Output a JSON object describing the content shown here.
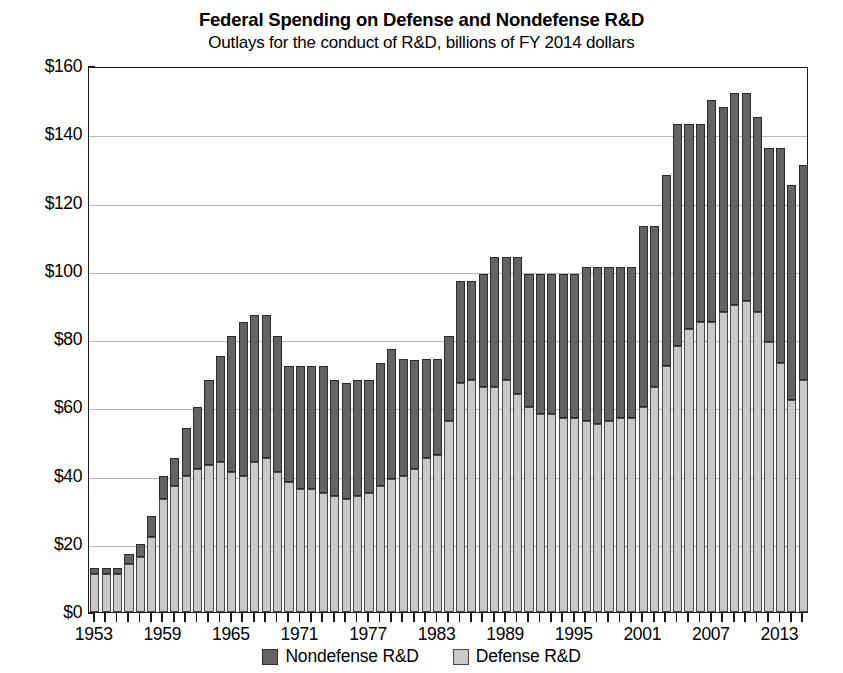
{
  "chart_data": {
    "type": "bar",
    "stacked": true,
    "title": "Federal Spending on Defense and Nondefense R&D",
    "subtitle": "Outlays for the conduct of R&D, billions of FY 2014 dollars",
    "xlabel": "",
    "ylabel": "",
    "ylim": [
      0,
      160
    ],
    "ytick_step": 20,
    "ytick_labels": [
      "$0",
      "$20",
      "$40",
      "$60",
      "$80",
      "$100",
      "$120",
      "$140",
      "$160"
    ],
    "grid": true,
    "legend_position": "bottom",
    "xtick_labels": [
      "1953",
      "1959",
      "1965",
      "1971",
      "1977",
      "1983",
      "1989",
      "1995",
      "2001",
      "2007",
      "2013"
    ],
    "xtick_years": [
      1953,
      1959,
      1965,
      1971,
      1977,
      1983,
      1989,
      1995,
      2001,
      2007,
      2013
    ],
    "colors": {
      "nondefense": "#636363",
      "defense": "#c9c9c9",
      "axis": "#1a1a1a",
      "grid": "#b9b9b9"
    },
    "categories": [
      1953,
      1954,
      1955,
      1956,
      1957,
      1958,
      1959,
      1960,
      1961,
      1962,
      1963,
      1964,
      1965,
      1966,
      1967,
      1968,
      1969,
      1970,
      1971,
      1972,
      1973,
      1974,
      1975,
      1976,
      1977,
      1978,
      1979,
      1980,
      1981,
      1982,
      1983,
      1984,
      1985,
      1986,
      1987,
      1988,
      1989,
      1990,
      1991,
      1992,
      1993,
      1994,
      1995,
      1996,
      1997,
      1998,
      1999,
      2000,
      2001,
      2002,
      2003,
      2004,
      2005,
      2006,
      2007,
      2008,
      2009,
      2010,
      2011,
      2012,
      2013,
      2014,
      2015
    ],
    "series": [
      {
        "name": "Defense R&D",
        "key": "defense",
        "color": "#c9c9c9",
        "values": [
          11,
          11,
          11,
          14,
          16,
          22,
          33,
          37,
          40,
          42,
          43,
          44,
          41,
          40,
          44,
          45,
          41,
          38,
          36,
          36,
          35,
          34,
          33,
          34,
          35,
          37,
          39,
          40,
          42,
          45,
          46,
          56,
          67,
          68,
          66,
          66,
          68,
          64,
          60,
          58,
          58,
          57,
          57,
          56,
          55,
          56,
          57,
          57,
          60,
          66,
          72,
          78,
          83,
          85,
          85,
          88,
          90,
          91,
          88,
          79,
          73,
          62,
          68
        ]
      },
      {
        "name": "Nondefense R&D",
        "key": "nondefense",
        "color": "#636363",
        "values": [
          2,
          2,
          2,
          3,
          4,
          6,
          7,
          8,
          14,
          18,
          25,
          31,
          40,
          45,
          43,
          42,
          40,
          34,
          36,
          36,
          37,
          34,
          34,
          34,
          33,
          36,
          38,
          34,
          32,
          29,
          28,
          25,
          30,
          29,
          33,
          38,
          36,
          40,
          39,
          41,
          41,
          42,
          42,
          45,
          46,
          45,
          44,
          44,
          53,
          47,
          56,
          65,
          60,
          58,
          65,
          60,
          62,
          61,
          57,
          57,
          63,
          63,
          63
        ]
      }
    ],
    "totals": [
      13,
      13,
      13,
      17,
      20,
      28,
      40,
      45,
      54,
      60,
      68,
      75,
      81,
      85,
      87,
      87,
      81,
      72,
      72,
      72,
      72,
      68,
      67,
      68,
      68,
      73,
      77,
      74,
      74,
      74,
      74,
      81,
      97,
      97,
      99,
      104,
      104,
      104,
      99,
      99,
      99,
      99,
      99,
      101,
      101,
      101,
      101,
      101,
      113,
      113,
      128,
      143,
      143,
      143,
      150,
      148,
      152,
      152,
      145,
      136,
      136,
      125,
      131
    ]
  }
}
